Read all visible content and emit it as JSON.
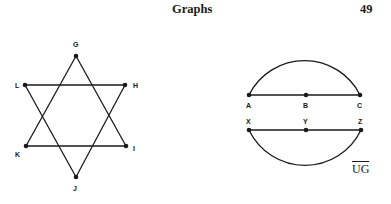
{
  "header": {
    "title": "Graphs",
    "page_number": "49"
  },
  "figure_star": {
    "vertices": [
      "G",
      "H",
      "I",
      "J",
      "K",
      "L"
    ],
    "triangles": [
      [
        "G",
        "I",
        "K"
      ],
      [
        "L",
        "H",
        "J"
      ]
    ]
  },
  "figure_circle": {
    "chord_top": [
      "A",
      "B",
      "C"
    ],
    "chord_bottom": [
      "X",
      "Y",
      "Z"
    ],
    "label": "UG"
  }
}
